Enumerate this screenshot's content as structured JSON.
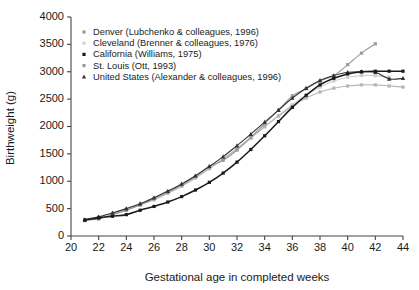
{
  "chart_data": {
    "type": "line",
    "title": "",
    "xlabel": "Gestational age in completed weeks",
    "ylabel": "Birthweight (g)",
    "xlim": [
      20,
      44
    ],
    "ylim": [
      0,
      4000
    ],
    "xticks": [
      20,
      22,
      24,
      26,
      28,
      30,
      32,
      34,
      36,
      38,
      40,
      42,
      44
    ],
    "yticks": [
      0,
      500,
      1000,
      1500,
      2000,
      2500,
      3000,
      3500,
      4000
    ],
    "grid": false,
    "legend_position": "upper-left-inside",
    "series": [
      {
        "name": "Denver (Lubchenko & colleagues, 1996)",
        "color": "#9a9a9a",
        "marker": "square",
        "x": [
          21,
          22,
          23,
          24,
          25,
          26,
          27,
          28,
          29,
          30,
          31,
          32,
          33,
          34,
          35,
          36,
          37,
          38,
          39,
          40,
          41,
          42
        ],
        "y": [
          290,
          310,
          390,
          470,
          570,
          680,
          800,
          930,
          1090,
          1270,
          1380,
          1570,
          1800,
          2050,
          2300,
          2560,
          2690,
          2830,
          2930,
          3130,
          3340,
          3510
        ]
      },
      {
        "name": "Cleveland (Brenner & colleagues, 1976)",
        "color": "#cfcfcf",
        "marker": "square",
        "x": [
          21,
          22,
          23,
          24,
          25,
          26,
          27,
          28,
          29,
          30,
          31,
          32,
          33,
          34,
          35,
          36,
          37,
          38,
          39,
          40,
          41,
          42,
          43
        ],
        "y": [
          300,
          350,
          420,
          500,
          590,
          690,
          800,
          930,
          1070,
          1230,
          1400,
          1580,
          1780,
          1990,
          2200,
          2400,
          2570,
          2720,
          2830,
          2900,
          2930,
          2930,
          2900
        ]
      },
      {
        "name": "California (Williams, 1975)",
        "color": "#1a1a1a",
        "marker": "square",
        "x": [
          21,
          22,
          23,
          24,
          25,
          26,
          27,
          28,
          29,
          30,
          31,
          32,
          33,
          34,
          35,
          36,
          37,
          38,
          39,
          40,
          41,
          42,
          43,
          44
        ],
        "y": [
          290,
          330,
          360,
          390,
          470,
          540,
          620,
          720,
          840,
          980,
          1150,
          1350,
          1580,
          1830,
          2090,
          2350,
          2570,
          2760,
          2880,
          2960,
          3000,
          3010,
          3010,
          3010
        ]
      },
      {
        "name": "St. Louis (Ott, 1993)",
        "color": "#b5b5b5",
        "marker": "square",
        "x": [
          21,
          22,
          23,
          24,
          25,
          26,
          27,
          28,
          29,
          30,
          31,
          32,
          33,
          34,
          35,
          36,
          37,
          38,
          39,
          40,
          41,
          42,
          43,
          44
        ],
        "y": [
          280,
          320,
          390,
          470,
          560,
          660,
          780,
          910,
          1060,
          1230,
          1410,
          1600,
          1800,
          2000,
          2190,
          2370,
          2520,
          2630,
          2700,
          2740,
          2760,
          2760,
          2740,
          2720
        ]
      },
      {
        "name": "United States (Alexander & colleagues, 1996)",
        "color": "#333333",
        "marker": "triangle",
        "x": [
          21,
          22,
          23,
          24,
          25,
          26,
          27,
          28,
          29,
          30,
          31,
          32,
          33,
          34,
          35,
          36,
          37,
          38,
          39,
          40,
          41,
          42,
          43,
          44
        ],
        "y": [
          300,
          350,
          420,
          500,
          590,
          700,
          820,
          950,
          1100,
          1270,
          1450,
          1650,
          1860,
          2080,
          2300,
          2520,
          2700,
          2840,
          2930,
          2990,
          3000,
          2990,
          2870,
          2880
        ]
      }
    ],
    "legend_entries": [
      {
        "label": "Denver (Lubchenko & colleagues, 1996)",
        "color": "#9a9a9a",
        "marker": "square"
      },
      {
        "label": "Cleveland (Brenner & colleagues, 1976)",
        "color": "#d2d2d2",
        "marker": "square"
      },
      {
        "label": "California (Williams, 1975)",
        "color": "#1a1a1a",
        "marker": "square"
      },
      {
        "label": "St. Louis (Ott, 1993)",
        "color": "#9a9a9a",
        "marker": "square"
      },
      {
        "label": "United States (Alexander & colleagues, 1996)",
        "color": "#3a3a3a",
        "marker": "triangle"
      }
    ]
  }
}
